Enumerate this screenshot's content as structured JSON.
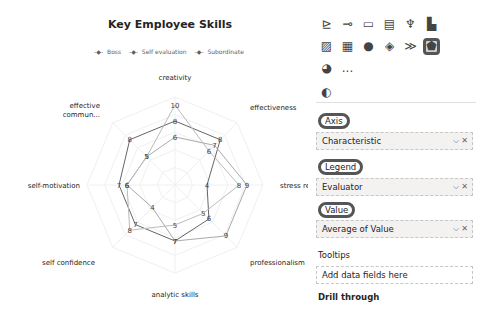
{
  "chart": {
    "title": "Key Employee Skills",
    "legend": [
      "Boss",
      "Self evaluation",
      "Subordinate"
    ]
  },
  "chart_data": {
    "type": "radar",
    "title": "Key Employee Skills",
    "categories": [
      "creativity",
      "effectiveness",
      "stress resistanc...",
      "professionalism",
      "analytic skills",
      "self confidence",
      "self-motivation",
      "effective commun..."
    ],
    "series": [
      {
        "name": "Boss",
        "values": [
          8,
          8,
          4,
          6,
          7,
          7,
          7,
          8
        ]
      },
      {
        "name": "Self evaluation",
        "values": [
          6,
          7,
          9,
          9,
          7,
          4,
          6,
          5
        ]
      },
      {
        "name": "Subordinate",
        "values": [
          10,
          6,
          8,
          5,
          5,
          8,
          6,
          5
        ]
      }
    ],
    "range": [
      0,
      10
    ],
    "grid": true,
    "legend_position": "top"
  },
  "pane": {
    "viz_icons": [
      "line-cluster-icon",
      "decomposition-tree-icon",
      "qa-icon",
      "paginated-report-icon",
      "trophy-icon",
      "smart-narrative-icon",
      "shape-map-icon",
      "filter-icon",
      "globe-icon",
      "diamond-icon",
      "chevron-flow-icon",
      "radar-chart-icon",
      "pie-icon",
      "more-icon"
    ],
    "more_label": "...",
    "axis_label": "Axis",
    "axis_field": "Characteristic",
    "legend_label": "Legend",
    "legend_field": "Evaluator",
    "value_label": "Value",
    "value_field": "Average of Value",
    "tooltips_label": "Tooltips",
    "tooltips_placeholder": "Add data fields here",
    "drill_label": "Drill through"
  }
}
